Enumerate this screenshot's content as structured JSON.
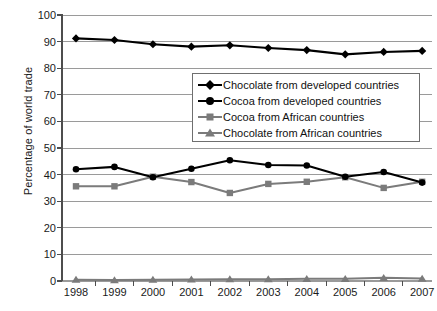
{
  "chart_data": {
    "type": "line",
    "title": "",
    "subtitle": "",
    "xlabel": "",
    "ylabel": "Percentage of world trade",
    "categories": [
      "1998",
      "1999",
      "2000",
      "2001",
      "2002",
      "2003",
      "2004",
      "2005",
      "2006",
      "2007"
    ],
    "x": [
      1998,
      1999,
      2000,
      2001,
      2002,
      2003,
      2004,
      2005,
      2006,
      2007
    ],
    "ylim": [
      0,
      100
    ],
    "yticks": [
      0,
      10,
      20,
      30,
      40,
      50,
      60,
      70,
      80,
      90,
      100
    ],
    "grid": "horizontal",
    "legend_position": "upper-center-right",
    "series": [
      {
        "name": "Chocolate from developed countries",
        "marker": "diamond",
        "color": "#000000",
        "values": [
          91.2,
          90.6,
          89.0,
          88.1,
          88.6,
          87.6,
          86.8,
          85.2,
          86.1,
          86.5
        ]
      },
      {
        "name": "Cocoa from developed countries",
        "marker": "circle",
        "color": "#000000",
        "values": [
          42.0,
          42.9,
          39.0,
          42.2,
          45.4,
          43.6,
          43.4,
          39.2,
          41.0,
          37.0
        ]
      },
      {
        "name": "Cocoa from African countries",
        "marker": "square",
        "color": "#7b7b7b",
        "values": [
          35.6,
          35.6,
          39.2,
          37.2,
          33.1,
          36.5,
          37.3,
          39.0,
          35.0,
          37.3
        ]
      },
      {
        "name": "Chocolate from African countries",
        "marker": "triangle",
        "color": "#7b7b7b",
        "values": [
          0.5,
          0.4,
          0.5,
          0.6,
          0.7,
          0.7,
          0.8,
          0.8,
          1.2,
          0.9
        ]
      }
    ]
  },
  "legend": {
    "items": [
      {
        "label": "Chocolate from developed countries",
        "marker": "diamond",
        "color": "#000000"
      },
      {
        "label": "Cocoa from developed countries",
        "marker": "circle",
        "color": "#000000"
      },
      {
        "label": "Cocoa from African countries",
        "marker": "square",
        "color": "#7b7b7b"
      },
      {
        "label": "Chocolate from African countries",
        "marker": "triangle",
        "color": "#7b7b7b"
      }
    ]
  },
  "axes": {
    "y_title": "Percentage of world trade",
    "y_tick_labels": [
      "100",
      "90",
      "80",
      "70",
      "60",
      "50",
      "40",
      "30",
      "20",
      "10",
      "0"
    ],
    "x_tick_labels": [
      "1998",
      "1999",
      "2000",
      "2001",
      "2002",
      "2003",
      "2004",
      "2005",
      "2006",
      "2007"
    ]
  },
  "colors": {
    "series_dark": "#000000",
    "series_gray": "#7b7b7b",
    "gridline": "#9a9a9a",
    "axis": "#4d4d4d",
    "text": "#1a1a1a",
    "background": "#ffffff"
  }
}
